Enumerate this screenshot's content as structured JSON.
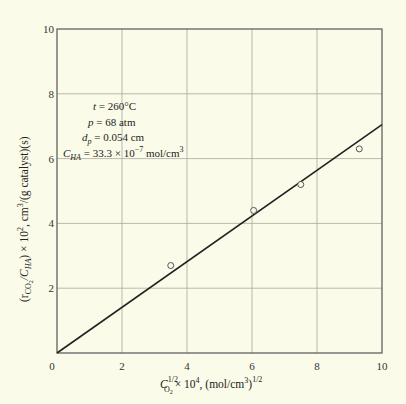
{
  "chart_data": {
    "type": "scatter",
    "title": "",
    "xlabel": "C_O2^(1/2) × 10^4, (mol/cm^3)^(1/2)",
    "ylabel": "(r_CO2 / C_HA) × 10^2, cm^3/(g catalyst)(s)",
    "xlim": [
      0,
      10
    ],
    "ylim": [
      0,
      10
    ],
    "x_ticks": [
      "0",
      "2",
      "4",
      "6",
      "8",
      "10"
    ],
    "y_ticks": [
      "0",
      "2",
      "4",
      "6",
      "8",
      "10"
    ],
    "grid": true,
    "series": [
      {
        "name": "data",
        "marker": "open-circle",
        "points": [
          {
            "x": 3.5,
            "y": 2.7
          },
          {
            "x": 6.05,
            "y": 4.4
          },
          {
            "x": 7.5,
            "y": 5.2
          },
          {
            "x": 9.3,
            "y": 6.3
          }
        ]
      },
      {
        "name": "fit",
        "type": "line",
        "points": [
          {
            "x": 0,
            "y": 0
          },
          {
            "x": 10,
            "y": 7.05
          }
        ]
      }
    ],
    "annotations": {
      "t": {
        "symbol": "t",
        "value": "= 260°C"
      },
      "p": {
        "symbol": "p",
        "value": "= 68 atm"
      },
      "dp": {
        "symbol": "d",
        "sub": "p",
        "value": "= 0.054 cm"
      },
      "cha": {
        "symbol": "C",
        "sub": "HA",
        "value": "= 33.3 × 10",
        "exp": "−7",
        "unit": " mol/cm",
        "unit_exp": "3"
      }
    },
    "xlabel_parts": {
      "sym": "C",
      "sup": "1/2",
      "sub": "O",
      "subsub": "2",
      "rest": "× 10",
      "rest_exp": "4",
      "tail": ", (mol/cm",
      "tail_exp": "3",
      "tail2": ")",
      "tail2_exp": "1/2"
    },
    "ylabel_parts": {
      "open": "(r",
      "sub1": "CO",
      "subsub1": "2",
      "mid": "/C",
      "sub2": "HA",
      "rest": ") × 10",
      "rest_exp": "2",
      "tail": ", cm",
      "tail_exp": "3",
      "tail2": "/(g catalyst)(s)"
    }
  }
}
